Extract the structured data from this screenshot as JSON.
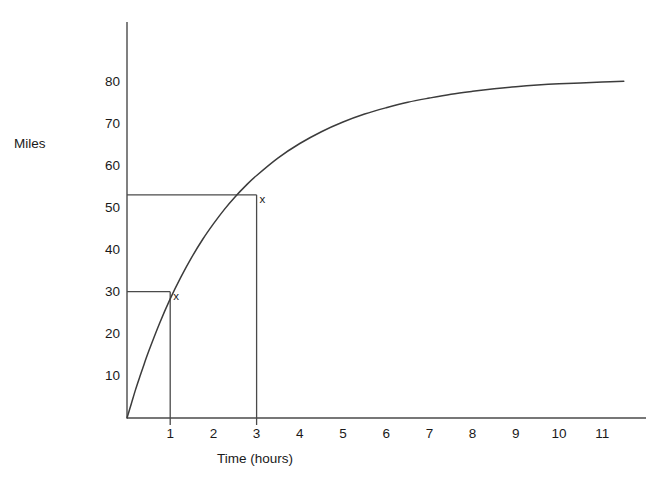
{
  "chart_data": {
    "type": "line",
    "title": "",
    "subtitle": "",
    "xlabel": "Time (hours)",
    "ylabel": "Miles",
    "xlim": [
      0,
      12.1
    ],
    "ylim": [
      0,
      92
    ],
    "grid": false,
    "legend": null,
    "x_ticks": [
      "1",
      "2",
      "3",
      "4",
      "5",
      "6",
      "7",
      "8",
      "9",
      "10",
      "11"
    ],
    "x_tick_values": [
      1,
      2,
      3,
      4,
      5,
      6,
      7,
      8,
      9,
      10,
      11
    ],
    "y_ticks": [
      "10",
      "20",
      "30",
      "40",
      "50",
      "60",
      "70",
      "80"
    ],
    "y_tick_values": [
      10,
      20,
      30,
      40,
      50,
      60,
      70,
      80
    ],
    "series": [
      {
        "name": "distance",
        "x": [
          0,
          0.1,
          0.2,
          0.3,
          0.4,
          0.5,
          0.75,
          1,
          1.25,
          1.5,
          1.75,
          2,
          2.25,
          2.5,
          2.75,
          3,
          3.5,
          4,
          4.5,
          5,
          5.5,
          6,
          6.5,
          7,
          7.5,
          8,
          8.5,
          9,
          9.5,
          10,
          10.5,
          11,
          11.5
        ],
        "values": [
          0,
          3.4,
          6.8,
          9.9,
          12.9,
          15.8,
          22.4,
          28.3,
          33.5,
          38.2,
          42.4,
          46.1,
          49.5,
          52.5,
          55.2,
          57.6,
          61.8,
          65.2,
          68.0,
          70.3,
          72.2,
          73.7,
          75.0,
          76.0,
          76.9,
          77.6,
          78.2,
          78.7,
          79.1,
          79.4,
          79.6,
          79.8,
          80.0
        ]
      }
    ],
    "annotations": [
      {
        "label": "x",
        "x": 1,
        "y": 30,
        "guide_horizontal_to_axis": true,
        "guide_vertical_to_axis": true
      },
      {
        "label": "x",
        "x": 3,
        "y": 53,
        "guide_horizontal_to_axis": true,
        "guide_vertical_to_axis": true
      }
    ]
  },
  "axes": {
    "y_axis_title": "Miles",
    "x_axis_title": "Time (hours)"
  }
}
